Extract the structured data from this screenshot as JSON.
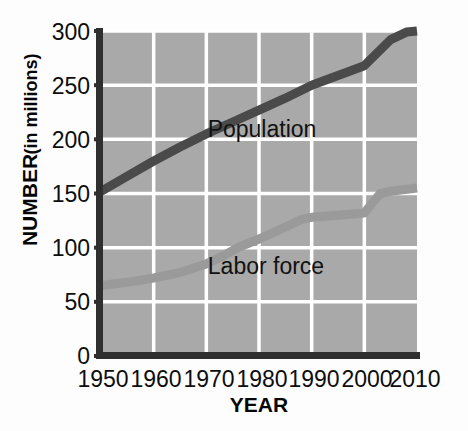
{
  "chart_data": {
    "type": "line",
    "title": "",
    "xlabel": "YEAR",
    "ylabel": "NUMBER (in millions)",
    "ylabel_main": "NUMBER",
    "ylabel_units": "(in millions)",
    "x": [
      1950,
      1960,
      1970,
      1980,
      1990,
      2000,
      2010
    ],
    "xtick_labels": [
      "1950",
      "1960",
      "1970",
      "1980",
      "1990",
      "2000",
      "2010"
    ],
    "ytick_labels": [
      "300",
      "250",
      "200",
      "150",
      "100",
      "50",
      "0"
    ],
    "yticks": [
      300,
      250,
      200,
      150,
      100,
      50,
      0
    ],
    "xlim": [
      1950,
      2010
    ],
    "ylim": [
      0,
      300
    ],
    "grid": true,
    "grid_color": "#ffffff",
    "plot_background": "#a8a8a8",
    "legend_position": "inline-annotation",
    "series": [
      {
        "name": "Population",
        "color": "#4a4a4a",
        "label_x": 1980,
        "label_y": 218,
        "values": [
          152,
          180,
          205,
          227,
          250,
          268,
          300
        ]
      },
      {
        "name": "Labor force",
        "color": "#9a9a9a",
        "label_x": 1980,
        "label_y": 92,
        "values": [
          65,
          72,
          85,
          108,
          126,
          132,
          155
        ]
      }
    ],
    "detail_points": {
      "Population": [
        [
          1950,
          152
        ],
        [
          1955,
          166
        ],
        [
          1960,
          180
        ],
        [
          1965,
          193
        ],
        [
          1970,
          205
        ],
        [
          1975,
          216
        ],
        [
          1980,
          227
        ],
        [
          1985,
          238
        ],
        [
          1990,
          250
        ],
        [
          1995,
          259
        ],
        [
          2000,
          268
        ],
        [
          2005,
          292
        ],
        [
          2008,
          299
        ],
        [
          2010,
          300
        ]
      ],
      "Labor force": [
        [
          1950,
          65
        ],
        [
          1955,
          68
        ],
        [
          1960,
          72
        ],
        [
          1965,
          77
        ],
        [
          1970,
          85
        ],
        [
          1973,
          92
        ],
        [
          1976,
          100
        ],
        [
          1980,
          108
        ],
        [
          1985,
          119
        ],
        [
          1988,
          126
        ],
        [
          1990,
          128
        ],
        [
          1995,
          130
        ],
        [
          2000,
          132
        ],
        [
          2003,
          150
        ],
        [
          2005,
          152
        ],
        [
          2010,
          155
        ]
      ]
    }
  },
  "axis": {
    "x_title": "YEAR",
    "y_title_main": "NUMBER",
    "y_title_units": "(in millions)"
  },
  "annotations": {
    "population_label": "Population",
    "labor_force_label": "Labor force"
  }
}
